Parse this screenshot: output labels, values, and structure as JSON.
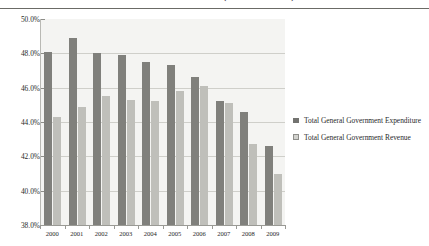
{
  "figure": {
    "title": "and Deficits 2000–09 (Percent of GDP)",
    "title_note": "top line of title is cropped above the image edge"
  },
  "legend": {
    "position": "right",
    "items": [
      {
        "key": "expenditure",
        "label": "Total General Government Expenditure",
        "color": "#737370",
        "swatch": "filled-square"
      },
      {
        "key": "revenue",
        "label": "Total General Government Revenue",
        "color": "#d2d2ce",
        "swatch": "outlined-square"
      }
    ]
  },
  "axes": {
    "y_ticks": [
      "38.0%",
      "40.0%",
      "42.0%",
      "44.0%",
      "46.0%",
      "48.0%",
      "50.0%"
    ],
    "x_ticks": [
      "2000",
      "2001",
      "2002",
      "2003",
      "2004",
      "2005",
      "2006",
      "2007",
      "2008",
      "2009"
    ]
  },
  "chart_data": {
    "type": "bar",
    "title": "and Deficits 2000–09 (Percent of GDP)",
    "xlabel": "",
    "ylabel": "",
    "ylim": [
      38.0,
      50.0
    ],
    "ytick_step": 2.0,
    "grid": true,
    "legend_position": "right",
    "categories": [
      "2000",
      "2001",
      "2002",
      "2003",
      "2004",
      "2005",
      "2006",
      "2007",
      "2008",
      "2009"
    ],
    "series": [
      {
        "name": "Total General Government Expenditure",
        "color": "#80807c",
        "values": [
          48.1,
          48.9,
          48.0,
          47.9,
          47.5,
          47.3,
          46.6,
          45.2,
          44.6,
          42.6
        ]
      },
      {
        "name": "Total General Government Revenue",
        "color": "#bfbfba",
        "values": [
          44.3,
          44.9,
          45.5,
          45.3,
          45.2,
          45.8,
          46.1,
          45.1,
          42.7,
          41.0
        ]
      }
    ]
  }
}
